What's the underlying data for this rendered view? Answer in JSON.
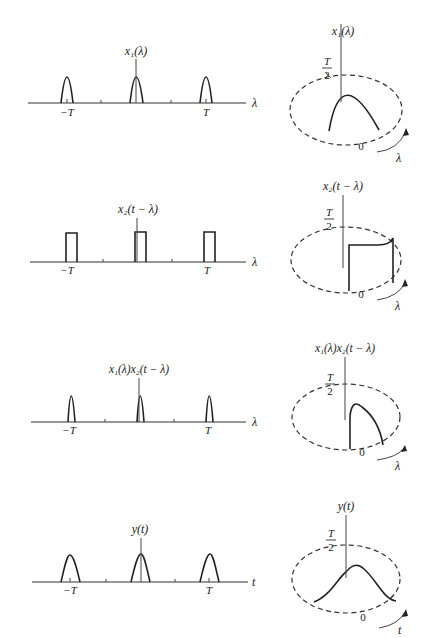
{
  "figure": {
    "panels": [
      {
        "id": "x1",
        "linear": {
          "label": "x₁(λ)",
          "axis_var": "λ",
          "neg_tick": "−T",
          "pos_tick": "T",
          "pulse_shape": "parabolic-arch"
        },
        "circular": {
          "label": "x₁(λ)",
          "half_period_num": "T",
          "half_period_den": "2",
          "zero_label": "0",
          "rotation_var": "λ"
        }
      },
      {
        "id": "x2-shifted",
        "linear": {
          "label": "x₂(t − λ)",
          "axis_var": "λ",
          "neg_tick": "−T",
          "pos_tick": "T",
          "pulse_shape": "rectangular"
        },
        "circular": {
          "label": "x₂(t − λ)",
          "half_period_num": "T",
          "half_period_den": "2",
          "zero_label": "0",
          "rotation_var": "λ"
        }
      },
      {
        "id": "product",
        "linear": {
          "label": "x₁(λ)x₂(t − λ)",
          "axis_var": "λ",
          "neg_tick": "−T",
          "pos_tick": "T",
          "pulse_shape": "narrow-arch"
        },
        "circular": {
          "label": "x₁(λ)x₂(t − λ)",
          "half_period_num": "T",
          "half_period_den": "2",
          "zero_label": "0",
          "rotation_var": "λ"
        }
      },
      {
        "id": "y",
        "linear": {
          "label": "y(t)",
          "axis_var": "t",
          "neg_tick": "−T",
          "pos_tick": "T",
          "pulse_shape": "smooth-bump"
        },
        "circular": {
          "label": "y(t)",
          "half_period_num": "T",
          "half_period_den": "2",
          "zero_label": "0",
          "rotation_var": "t"
        }
      }
    ]
  }
}
